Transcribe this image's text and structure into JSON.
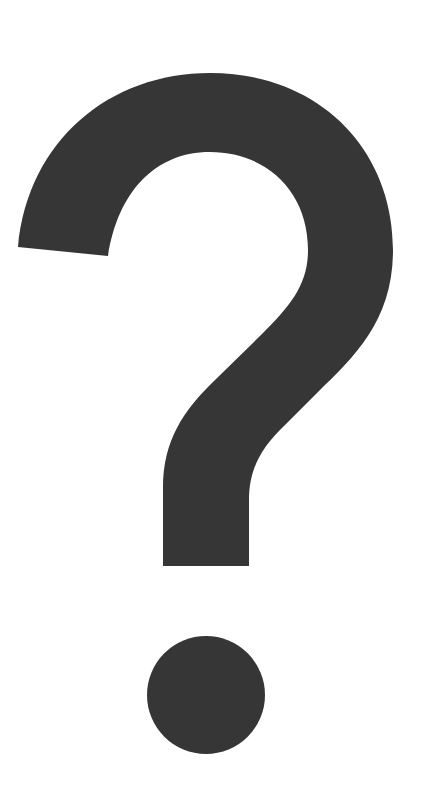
{
  "image": {
    "subject": "question mark",
    "glyph": "?",
    "icon": "question-mark-icon",
    "background_color": "#ffffff",
    "glyph_color": "#363636"
  }
}
